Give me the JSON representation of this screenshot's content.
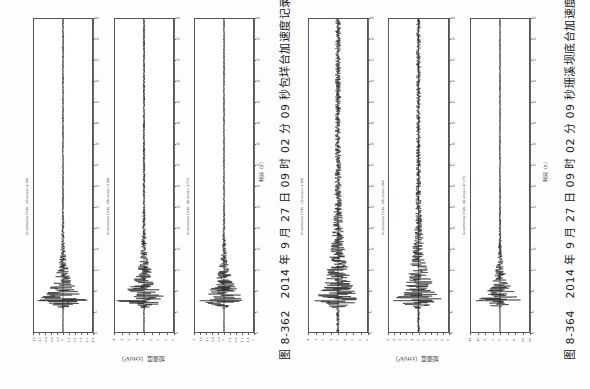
{
  "figures": [
    {
      "id": "fig-8-362",
      "caption": "图 8-362　2014 年 9 月 27 日 09 时 02 分 09 秒包垟台加速度记录",
      "time_label": "时间（s）",
      "acc_label": "加速度（cm/s²）"
    },
    {
      "id": "fig-8-364",
      "caption": "图 8-364　2014 年 9 月 27 日 09 时 02 分 09 秒珊溪坝底台加速度记录",
      "time_label": "时间（s）",
      "acc_label": "加速度（cm/s²）"
    }
  ],
  "chart_data": [
    {
      "type": "line",
      "title": "图 8-362 包垟台加速度记录 UD",
      "station_label": "Acceleration 72(#)...UD amax=-1.386",
      "xlabel": "时间（s）",
      "ylabel": "加速度（cm/s²）",
      "xlim": [
        0,
        60
      ],
      "ylim": [
        -1.5,
        1.5
      ],
      "peak_time": 6,
      "peak_amp": 1.386,
      "decay": 0.09,
      "noise": 0.03
    },
    {
      "type": "line",
      "title": "图 8-362 包垟台加速度记录 EW",
      "station_label": "Acceleration 72(#)...EW amax=-3.983",
      "xlabel": "时间（s）",
      "ylabel": "加速度（cm/s²）",
      "xlim": [
        0,
        60
      ],
      "ylim": [
        -4,
        4
      ],
      "peak_time": 6,
      "peak_amp": 3.983,
      "decay": 0.08,
      "noise": 0.04
    },
    {
      "type": "line",
      "title": "图 8-362 包垟台加速度记录 NS",
      "station_label": "Acceleration 72(#)...NS amax=-1.773",
      "xlabel": "时间（s）",
      "ylabel": "加速度（cm/s²）",
      "xlim": [
        0,
        60
      ],
      "ylim": [
        -2,
        2
      ],
      "peak_time": 6,
      "peak_amp": 1.773,
      "decay": 0.09,
      "noise": 0.03
    },
    {
      "type": "line",
      "title": "图 8-364 珊溪坝底台加速度记录 UD",
      "station_label": "Acceleration 72(#)...UD amax=-3.386",
      "xlabel": "时间（s）",
      "ylabel": "加速度（cm/s²）",
      "xlim": [
        0,
        60
      ],
      "ylim": [
        -4,
        4
      ],
      "peak_time": 6,
      "peak_amp": 3.386,
      "decay": 0.05,
      "noise": 0.12
    },
    {
      "type": "line",
      "title": "图 8-364 珊溪坝底台加速度记录 EW",
      "station_label": "Acceleration 72(#)...EW amax=-984",
      "xlabel": "时间（s）",
      "ylabel": "加速度（cm/s²）",
      "xlim": [
        0,
        60
      ],
      "ylim": [
        -5,
        5
      ],
      "peak_time": 6,
      "peak_amp": 4.5,
      "decay": 0.06,
      "noise": 0.09
    },
    {
      "type": "line",
      "title": "图 8-364 珊溪坝底台加速度记录 NS",
      "station_label": "Acceleration 72(#)...NS amax=-12.273",
      "xlabel": "时间（s）",
      "ylabel": "加速度（cm/s²）",
      "xlim": [
        0,
        60
      ],
      "ylim": [
        -14,
        14
      ],
      "peak_time": 6,
      "peak_amp": 12.273,
      "decay": 0.1,
      "noise": 0.03
    }
  ],
  "time_ticks": [
    "0",
    "4",
    "8",
    "12",
    "16",
    "20",
    "24",
    "28",
    "32",
    "36",
    "40",
    "44",
    "48",
    "52",
    "56",
    "60"
  ],
  "acc_ticks": {
    "0": [
      "-1.5",
      "-1.2",
      "-0.9",
      "-0.6",
      "-0.3",
      "0",
      "0.3",
      "0.6",
      "0.9",
      "1.2",
      "1.5"
    ],
    "1": [
      "-4",
      "-3",
      "-2",
      "-1",
      "0",
      "1",
      "2",
      "3",
      "4"
    ],
    "2": [
      "-2",
      "-1.6",
      "-1.2",
      "-0.8",
      "-0.4",
      "0",
      "0.4",
      "0.8",
      "1.2",
      "1.6",
      "2"
    ],
    "3": [
      "-4",
      "-3",
      "-2",
      "-1",
      "0",
      "1",
      "2",
      "3",
      "4"
    ],
    "4": [
      "-5",
      "-4",
      "-3",
      "-2",
      "-1",
      "0",
      "1",
      "2",
      "3",
      "4",
      "5"
    ],
    "5": [
      "-14",
      "-10",
      "-6",
      "-2",
      "0",
      "2",
      "6",
      "10",
      "14"
    ]
  }
}
